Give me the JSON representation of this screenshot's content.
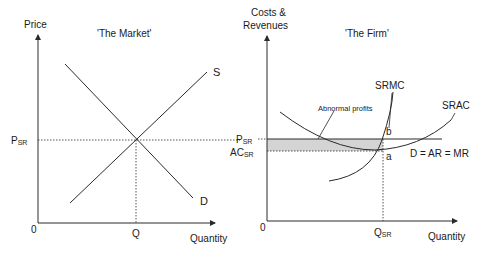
{
  "market": {
    "title": "'The Market'",
    "y_axis_label": "Price",
    "x_axis_label": "Quantity",
    "origin_label": "0",
    "price_label_main": "P",
    "price_label_sub": "SR",
    "quantity_label": "Q",
    "supply_label": "S",
    "demand_label": "D"
  },
  "firm": {
    "title": "'The Firm'",
    "y_axis_label_line1": "Costs &",
    "y_axis_label_line2": "Revenues",
    "x_axis_label": "Quantity",
    "origin_label": "0",
    "price_label_main": "P",
    "price_label_sub": "SR",
    "ac_label_main": "AC",
    "ac_label_sub": "SR",
    "quantity_label_main": "Q",
    "quantity_label_sub": "SR",
    "srmc_label": "SRMC",
    "srac_label": "SRAC",
    "demand_label": "D = AR = MR",
    "point_a": "a",
    "point_b": "b",
    "profit_annotation": "Abnormal profits"
  },
  "colors": {
    "line": "#2a2a2a",
    "shade": "#d4d4d4"
  }
}
